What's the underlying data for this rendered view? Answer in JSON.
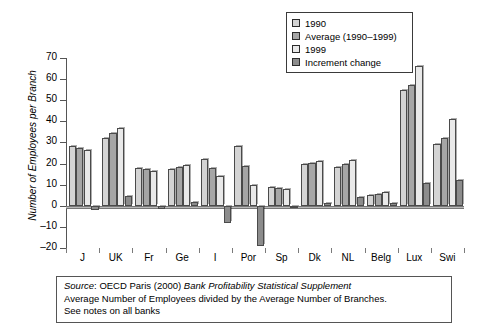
{
  "chart_data": {
    "type": "bar",
    "title": "",
    "xlabel": "",
    "ylabel": "Number of Employees per Branch",
    "ylim": [
      -20,
      70
    ],
    "yticks": [
      70,
      60,
      50,
      40,
      30,
      20,
      10,
      0,
      -10,
      -20
    ],
    "ytick_labels": [
      "70",
      "60",
      "50",
      "40",
      "30",
      "20",
      "10",
      "0",
      "–10",
      "–20"
    ],
    "grid": false,
    "legend_position": "top-right",
    "categories": [
      "J",
      "UK",
      "Fr",
      "Ge",
      "I",
      "Por",
      "Sp",
      "Dk",
      "NL",
      "Belg",
      "Lux",
      "Swi"
    ],
    "series": [
      {
        "name": "1990",
        "color": "#d4d4d4",
        "values": [
          28.5,
          32.0,
          18.0,
          17.5,
          22.0,
          28.5,
          9.0,
          20.0,
          18.5,
          5.0,
          55.0,
          29.5
        ]
      },
      {
        "name": "Average (1990–1999)",
        "color": "#a6a6a6",
        "values": [
          27.5,
          34.5,
          17.5,
          18.5,
          18.0,
          19.0,
          8.5,
          20.5,
          20.0,
          5.5,
          57.0,
          32.0
        ]
      },
      {
        "name": "1999",
        "color": "#e9e9e9",
        "values": [
          26.5,
          37.0,
          16.5,
          19.5,
          14.0,
          10.0,
          8.0,
          21.0,
          21.5,
          6.5,
          66.0,
          41.0
        ]
      },
      {
        "name": "Increment change",
        "color": "#8c8c8c",
        "values": [
          -2.0,
          4.5,
          -1.5,
          2.0,
          -8.0,
          -19.0,
          -1.0,
          1.5,
          4.0,
          1.5,
          11.0,
          12.0
        ]
      }
    ]
  },
  "legend": {
    "items": [
      {
        "label": "1990",
        "swatch": "#d4d4d4"
      },
      {
        "label": "Average (1990–1999)",
        "swatch": "#a6a6a6"
      },
      {
        "label": "1999",
        "swatch": "#e9e9e9"
      },
      {
        "label": "Increment change",
        "swatch": "#8c8c8c"
      }
    ]
  },
  "caption": {
    "line1_prefix": "Source",
    "line1_mid": ": OECD Paris (2000) ",
    "line1_italic": "Bank Profitability Statistical Supplement",
    "line2": "Average Number of Employees divided by the Average Number of Branches.",
    "line3": "See notes on all banks"
  }
}
